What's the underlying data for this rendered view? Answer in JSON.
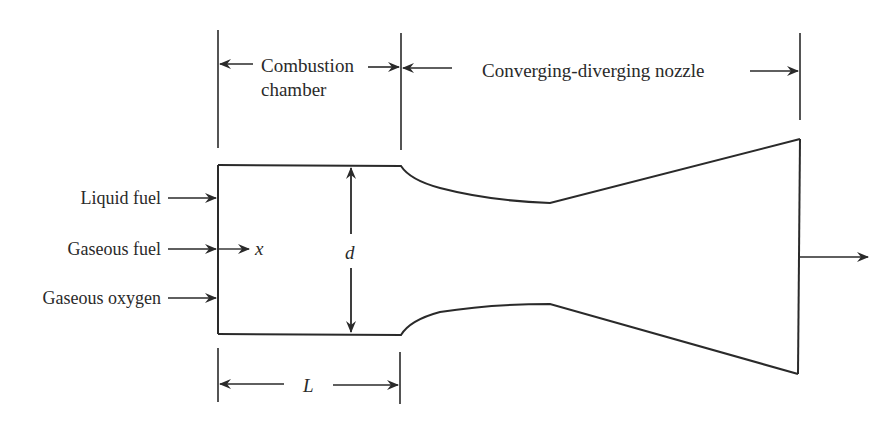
{
  "diagram": {
    "top_labels": {
      "combustion_chamber_line1": "Combustion",
      "combustion_chamber_line2": "chamber",
      "nozzle": "Converging-diverging nozzle"
    },
    "inlets": [
      {
        "label": "Liquid fuel"
      },
      {
        "label": "Gaseous fuel"
      },
      {
        "label": "Gaseous oxygen"
      }
    ],
    "symbols": {
      "axial_coordinate": "x",
      "diameter": "d",
      "length": "L"
    },
    "colors": {
      "stroke": "#2a2a2a",
      "background": "#ffffff"
    }
  }
}
